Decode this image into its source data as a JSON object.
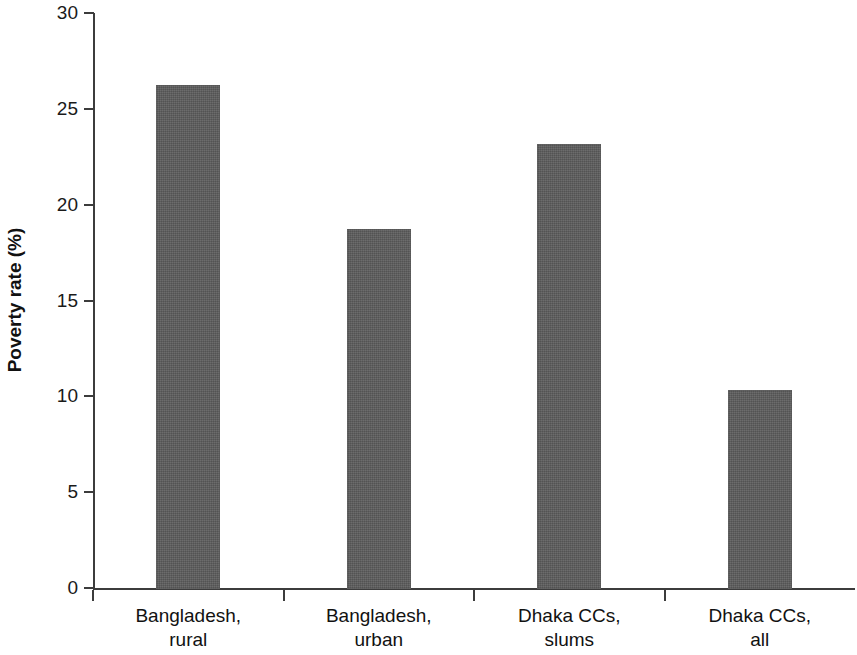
{
  "chart_data": {
    "type": "bar",
    "title": "",
    "subtitle": "",
    "xlabel": "",
    "ylabel": "Poverty rate (%)",
    "categories": [
      "Bangladesh, rural",
      "Bangladesh, urban",
      "Dhaka CCs, slums",
      "Dhaka CCs, all"
    ],
    "category_lines": [
      [
        "Bangladesh,",
        "rural"
      ],
      [
        "Bangladesh,",
        "urban"
      ],
      [
        "Dhaka CCs,",
        "slums"
      ],
      [
        "Dhaka CCs,",
        "all"
      ]
    ],
    "values": [
      26.3,
      18.8,
      23.2,
      10.4
    ],
    "ylim": [
      0,
      30
    ],
    "yticks": [
      0,
      5,
      10,
      15,
      20,
      25,
      30
    ],
    "ytick_labels": [
      "0",
      "5",
      "10",
      "15",
      "20",
      "25",
      "30"
    ],
    "grid": false,
    "legend": null,
    "bar_color": "#5b5b5b",
    "axis_color": "#3c3c3c"
  },
  "axis": {
    "y_title": "Poverty rate (%)"
  }
}
